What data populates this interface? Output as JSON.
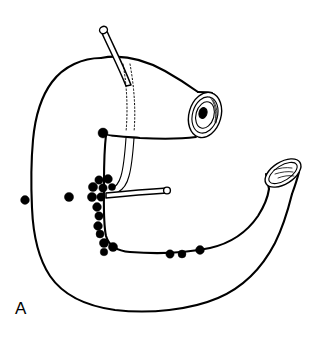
{
  "figure": {
    "panel_label": "A",
    "line_color": "#000000",
    "node_color": "#000000",
    "background_color": "#ffffff"
  },
  "parts": [
    {
      "id": "esophageal-stump",
      "label": "esophageal stump"
    },
    {
      "id": "duodenal-stump",
      "label": "duodenal stump"
    },
    {
      "id": "fundus",
      "label": "fundus"
    },
    {
      "id": "lesser-curvature",
      "label": "lesser curvature"
    },
    {
      "id": "greater-curvature",
      "label": "greater curvature"
    },
    {
      "id": "cannula-superior",
      "label": "superior cannula"
    },
    {
      "id": "cannula-antral",
      "label": "antral cannula"
    }
  ],
  "chart_data": {
    "type": "scatter",
    "xlabel": "",
    "ylabel": "",
    "xlim": [
      0,
      320
    ],
    "ylim": [
      340,
      0
    ],
    "grid": false,
    "legend": "none",
    "series": [
      {
        "name": "lesser-curvature-nodes",
        "values": [
          {
            "x": 103,
            "y": 133,
            "r": 5.0
          },
          {
            "x": 99,
            "y": 180,
            "r": 4.2
          },
          {
            "x": 108,
            "y": 179,
            "r": 4.4
          },
          {
            "x": 93,
            "y": 187,
            "r": 4.6
          },
          {
            "x": 103,
            "y": 188,
            "r": 4.2
          },
          {
            "x": 112,
            "y": 187,
            "r": 3.6
          },
          {
            "x": 92,
            "y": 197,
            "r": 4.6
          },
          {
            "x": 101,
            "y": 197,
            "r": 4.2
          },
          {
            "x": 97,
            "y": 207,
            "r": 4.4
          },
          {
            "x": 99,
            "y": 216,
            "r": 4.2
          },
          {
            "x": 98,
            "y": 226,
            "r": 4.4
          },
          {
            "x": 100,
            "y": 234,
            "r": 4.0
          },
          {
            "x": 104,
            "y": 243,
            "r": 4.6
          },
          {
            "x": 113,
            "y": 247,
            "r": 4.6
          },
          {
            "x": 104,
            "y": 252,
            "r": 3.8
          }
        ]
      },
      {
        "name": "greater-curvature-nodes",
        "values": [
          {
            "x": 170,
            "y": 254,
            "r": 4.2
          },
          {
            "x": 182,
            "y": 254,
            "r": 4.0
          },
          {
            "x": 200,
            "y": 250,
            "r": 4.4
          }
        ]
      },
      {
        "name": "free-nodes",
        "values": [
          {
            "x": 25,
            "y": 200,
            "r": 4.4
          },
          {
            "x": 69,
            "y": 197,
            "r": 4.6
          }
        ]
      }
    ]
  }
}
